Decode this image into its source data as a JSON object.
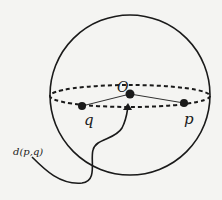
{
  "diagram": {
    "labels": {
      "center": "O",
      "point_q": "q",
      "point_p": "p",
      "distance": "d(p,q)"
    },
    "colors": {
      "stroke": "#1a1a1a",
      "background": "#f4f4f2"
    }
  }
}
